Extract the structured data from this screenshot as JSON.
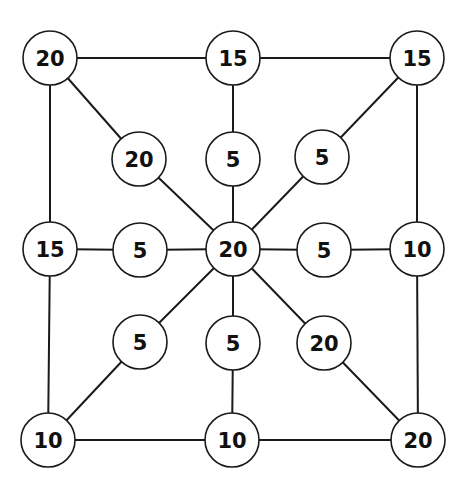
{
  "diagram": {
    "type": "graph",
    "node_radius": 27,
    "colors": {
      "stroke": "#1a1a1a",
      "fill": "#ffffff",
      "text": "#111111"
    },
    "nodes": [
      {
        "id": "tl",
        "label": "20",
        "x": 50,
        "y": 58
      },
      {
        "id": "tm",
        "label": "15",
        "x": 233,
        "y": 58
      },
      {
        "id": "tr",
        "label": "15",
        "x": 417,
        "y": 58
      },
      {
        "id": "il_up",
        "label": "20",
        "x": 139,
        "y": 159
      },
      {
        "id": "im_up",
        "label": "5",
        "x": 233,
        "y": 159
      },
      {
        "id": "ir_up",
        "label": "5",
        "x": 322,
        "y": 157
      },
      {
        "id": "ml",
        "label": "15",
        "x": 50,
        "y": 249
      },
      {
        "id": "il_mid",
        "label": "5",
        "x": 140,
        "y": 250
      },
      {
        "id": "center",
        "label": "20",
        "x": 233,
        "y": 249
      },
      {
        "id": "ir_mid",
        "label": "5",
        "x": 324,
        "y": 250
      },
      {
        "id": "mr",
        "label": "10",
        "x": 417,
        "y": 249
      },
      {
        "id": "il_low",
        "label": "5",
        "x": 140,
        "y": 342
      },
      {
        "id": "im_low",
        "label": "5",
        "x": 233,
        "y": 343
      },
      {
        "id": "ir_low",
        "label": "20",
        "x": 324,
        "y": 343
      },
      {
        "id": "bl",
        "label": "10",
        "x": 48,
        "y": 440
      },
      {
        "id": "bm",
        "label": "10",
        "x": 232,
        "y": 440
      },
      {
        "id": "br",
        "label": "20",
        "x": 418,
        "y": 440
      }
    ],
    "edges": [
      [
        "tl",
        "tm"
      ],
      [
        "tm",
        "tr"
      ],
      [
        "tl",
        "ml"
      ],
      [
        "ml",
        "bl"
      ],
      [
        "tr",
        "mr"
      ],
      [
        "mr",
        "br"
      ],
      [
        "bl",
        "bm"
      ],
      [
        "bm",
        "br"
      ],
      [
        "tl",
        "il_up"
      ],
      [
        "il_up",
        "center"
      ],
      [
        "tm",
        "im_up"
      ],
      [
        "im_up",
        "center"
      ],
      [
        "tr",
        "ir_up"
      ],
      [
        "ir_up",
        "center"
      ],
      [
        "ml",
        "il_mid"
      ],
      [
        "il_mid",
        "center"
      ],
      [
        "center",
        "ir_mid"
      ],
      [
        "ir_mid",
        "mr"
      ],
      [
        "center",
        "il_low"
      ],
      [
        "il_low",
        "bl"
      ],
      [
        "center",
        "im_low"
      ],
      [
        "im_low",
        "bm"
      ],
      [
        "center",
        "ir_low"
      ],
      [
        "ir_low",
        "br"
      ]
    ]
  }
}
